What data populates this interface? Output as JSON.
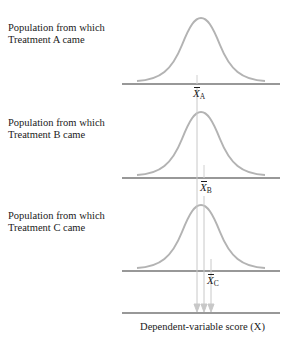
{
  "panels": [
    {
      "id": "A",
      "label_line1": "Population from which",
      "label_line2": "Treatment A came",
      "mean_symbol": "X",
      "mean_subscript": "A"
    },
    {
      "id": "B",
      "label_line1": "Population from which",
      "label_line2": "Treatment B came",
      "mean_symbol": "X",
      "mean_subscript": "B"
    },
    {
      "id": "C",
      "label_line1": "Population from which",
      "label_line2": "Treatment C came",
      "mean_symbol": "X",
      "mean_subscript": "C"
    }
  ],
  "axis": {
    "title": "Dependent-variable score (X)"
  },
  "colors": {
    "curve": "#b3b3b3",
    "axis": "#333333",
    "projection": "#c8c8c8",
    "text": "#1a1a1a"
  }
}
